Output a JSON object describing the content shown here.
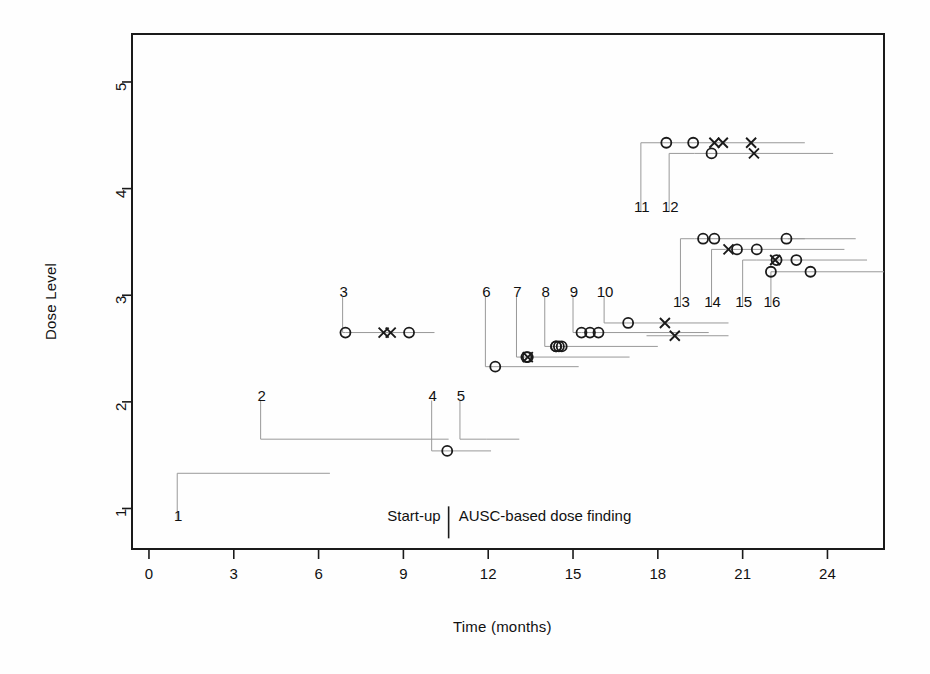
{
  "figure": {
    "background": "#fefefe",
    "ink_color": "#1a1a1a",
    "line_color": "#999999",
    "plot_box": {
      "left": 132,
      "top": 34,
      "right": 884,
      "bottom": 549
    }
  },
  "annotations": {
    "startup_label": "Start-up",
    "dosefinding_label": "AUSC-based dose finding",
    "divider_x_months": 10.6
  },
  "chart_data": {
    "type": "scatter",
    "title": "",
    "xlabel": "Time (months)",
    "ylabel": "Dose Level",
    "xlim": [
      -0.6,
      26.0
    ],
    "ylim": [
      0.62,
      5.45
    ],
    "xticks": [
      0,
      3,
      6,
      9,
      12,
      15,
      18,
      21,
      24
    ],
    "xtick_labels": [
      "0",
      "3",
      "6",
      "9",
      "12",
      "15",
      "18",
      "21",
      "24"
    ],
    "yticks": [
      1,
      2,
      3,
      4,
      5
    ],
    "ytick_labels": [
      "1",
      "2",
      "3",
      "4",
      "5"
    ],
    "grid": false,
    "legend": null,
    "marker_legend": {
      "circle": "o (observation / DLT-free)",
      "cross": "x (event)"
    },
    "patients": [
      {
        "id": "1",
        "label_x": 1.0,
        "label_y": 0.92,
        "dose": 1.33,
        "enroll": 1.0,
        "end": 6.4,
        "markers": []
      },
      {
        "id": "2",
        "label_x": 3.95,
        "label_y": 2.05,
        "dose": 1.65,
        "enroll": 3.95,
        "end": 10.6,
        "markers": []
      },
      {
        "id": "3",
        "label_x": 6.85,
        "label_y": 3.02,
        "dose": 2.65,
        "enroll": 6.95,
        "end": 10.1,
        "markers": [
          {
            "t": 6.95,
            "type": "circle"
          },
          {
            "t": 8.3,
            "type": "cross"
          },
          {
            "t": 8.55,
            "type": "cross"
          },
          {
            "t": 9.2,
            "type": "circle"
          }
        ]
      },
      {
        "id": "4",
        "label_x": 10.0,
        "label_y": 2.05,
        "dose": 1.54,
        "enroll": 10.5,
        "end": 12.1,
        "markers": [
          {
            "t": 10.55,
            "type": "circle"
          }
        ]
      },
      {
        "id": "5",
        "label_x": 11.0,
        "label_y": 2.05,
        "dose": 1.65,
        "enroll": 11.95,
        "end": 13.1,
        "markers": []
      },
      {
        "id": "6",
        "label_x": 11.9,
        "label_y": 3.02,
        "dose": 2.33,
        "enroll": 12.2,
        "end": 15.2,
        "markers": [
          {
            "t": 12.25,
            "type": "circle"
          }
        ]
      },
      {
        "id": "7",
        "label_x": 13.0,
        "label_y": 3.02,
        "dose": 2.42,
        "enroll": 13.35,
        "end": 17.0,
        "markers": [
          {
            "t": 13.4,
            "type": "circle"
          },
          {
            "t": 13.4,
            "type": "cross"
          },
          {
            "t": 13.35,
            "type": "circle"
          }
        ]
      },
      {
        "id": "8",
        "label_x": 14.0,
        "label_y": 3.02,
        "dose": 2.52,
        "enroll": 14.35,
        "end": 18.0,
        "markers": [
          {
            "t": 14.4,
            "type": "circle"
          },
          {
            "t": 14.5,
            "type": "circle"
          },
          {
            "t": 14.6,
            "type": "circle"
          },
          {
            "t": 14.4,
            "type": "circle"
          }
        ]
      },
      {
        "id": "9",
        "label_x": 15.0,
        "label_y": 3.02,
        "dose": 2.65,
        "enroll": 15.3,
        "end": 19.8,
        "markers": [
          {
            "t": 15.3,
            "type": "circle"
          },
          {
            "t": 15.6,
            "type": "circle"
          },
          {
            "t": 15.9,
            "type": "circle"
          }
        ]
      },
      {
        "id": "10",
        "label_x": 16.1,
        "label_y": 3.02,
        "dose": 2.74,
        "enroll": 16.9,
        "end": 20.5,
        "markers": [
          {
            "t": 16.95,
            "type": "circle"
          },
          {
            "t": 18.25,
            "type": "cross"
          }
        ]
      },
      {
        "id": "10b",
        "label_x": null,
        "label_y": null,
        "dose": 2.62,
        "enroll": 17.6,
        "end": 20.5,
        "markers": [
          {
            "t": 18.6,
            "type": "cross"
          }
        ]
      },
      {
        "id": "11",
        "label_x": 17.4,
        "label_y": 3.82,
        "dose": 4.43,
        "enroll": 17.9,
        "end": 23.2,
        "markers": [
          {
            "t": 18.3,
            "type": "circle"
          },
          {
            "t": 19.25,
            "type": "circle"
          },
          {
            "t": 20.0,
            "type": "cross"
          },
          {
            "t": 20.3,
            "type": "cross"
          },
          {
            "t": 21.3,
            "type": "cross"
          }
        ]
      },
      {
        "id": "12",
        "label_x": 18.4,
        "label_y": 3.82,
        "dose": 4.33,
        "enroll": 19.3,
        "end": 24.2,
        "markers": [
          {
            "t": 19.9,
            "type": "circle"
          },
          {
            "t": 21.4,
            "type": "cross"
          }
        ]
      },
      {
        "id": "13",
        "label_x": 18.8,
        "label_y": 2.93,
        "dose": 3.53,
        "enroll": 19.3,
        "end": 23.2,
        "markers": [
          {
            "t": 19.6,
            "type": "circle"
          },
          {
            "t": 20.0,
            "type": "circle"
          }
        ]
      },
      {
        "id": "14",
        "label_x": 19.9,
        "label_y": 2.93,
        "dose": 3.43,
        "enroll": 20.4,
        "end": 24.6,
        "markers": [
          {
            "t": 20.5,
            "type": "cross"
          },
          {
            "t": 20.8,
            "type": "circle"
          },
          {
            "t": 21.5,
            "type": "circle"
          }
        ]
      },
      {
        "id": "15",
        "label_x": 21.0,
        "label_y": 2.93,
        "dose": 3.33,
        "enroll": 21.5,
        "end": 25.4,
        "markers": [
          {
            "t": 22.2,
            "type": "circle"
          },
          {
            "t": 22.15,
            "type": "cross"
          },
          {
            "t": 22.9,
            "type": "circle"
          }
        ]
      },
      {
        "id": "16",
        "label_x": 22.0,
        "label_y": 2.93,
        "dose": 3.22,
        "enroll": 22.2,
        "end": 26.0,
        "markers": [
          {
            "t": 22.0,
            "type": "circle"
          },
          {
            "t": 23.4,
            "type": "circle"
          }
        ]
      },
      {
        "id": "15b",
        "label_x": null,
        "label_y": null,
        "dose": 3.53,
        "enroll": 22.6,
        "end": 25.0,
        "markers": [
          {
            "t": 22.55,
            "type": "circle"
          }
        ]
      }
    ]
  }
}
